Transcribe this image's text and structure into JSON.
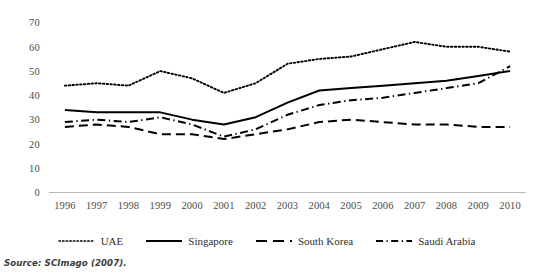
{
  "source_note": "Source: SCImago (2007).",
  "legend": {
    "items": [
      {
        "label": "UAE",
        "style": "dotted",
        "color": "#000000"
      },
      {
        "label": "Singapore",
        "style": "solid",
        "color": "#000000"
      },
      {
        "label": "South Korea",
        "style": "dashed",
        "color": "#000000"
      },
      {
        "label": "Saudi Arabia",
        "style": "dash-dot",
        "color": "#000000"
      }
    ]
  },
  "axes": {
    "y_ticks": [
      "0",
      "10",
      "20",
      "30",
      "40",
      "50",
      "60",
      "70"
    ],
    "x_ticks": [
      "1996",
      "1997",
      "1998",
      "1999",
      "2000",
      "2001",
      "2002",
      "2003",
      "2004",
      "2005",
      "2006",
      "2007",
      "2008",
      "2009",
      "2010"
    ]
  },
  "chart_data": {
    "type": "line",
    "title": "",
    "subtitle": "",
    "xlabel": "",
    "ylabel": "",
    "ylim": [
      0,
      70
    ],
    "ytick_step": 10,
    "grid": false,
    "legend_position": "bottom",
    "axis_line": "x-axis only, light gray baseline at y=0",
    "categories": [
      "1996",
      "1997",
      "1998",
      "1999",
      "2000",
      "2001",
      "2002",
      "2003",
      "2004",
      "2005",
      "2006",
      "2007",
      "2008",
      "2009",
      "2010"
    ],
    "series": [
      {
        "name": "UAE",
        "style": "dotted",
        "color": "#000000",
        "values": [
          44,
          45,
          44,
          50,
          47,
          41,
          45,
          53,
          55,
          56,
          59,
          62,
          60,
          60,
          58
        ]
      },
      {
        "name": "Singapore",
        "style": "solid",
        "color": "#000000",
        "values": [
          34,
          33,
          33,
          33,
          30,
          28,
          31,
          37,
          42,
          43,
          44,
          45,
          46,
          48,
          50
        ]
      },
      {
        "name": "South Korea",
        "style": "dashed",
        "color": "#000000",
        "values": [
          27,
          28,
          27,
          24,
          24,
          22,
          24,
          26,
          29,
          30,
          29,
          28,
          28,
          27,
          27
        ]
      },
      {
        "name": "Saudi Arabia",
        "style": "dash-dot",
        "color": "#000000",
        "values": [
          29,
          30,
          29,
          31,
          28,
          23,
          26,
          32,
          36,
          38,
          39,
          41,
          43,
          45,
          52
        ]
      }
    ]
  }
}
